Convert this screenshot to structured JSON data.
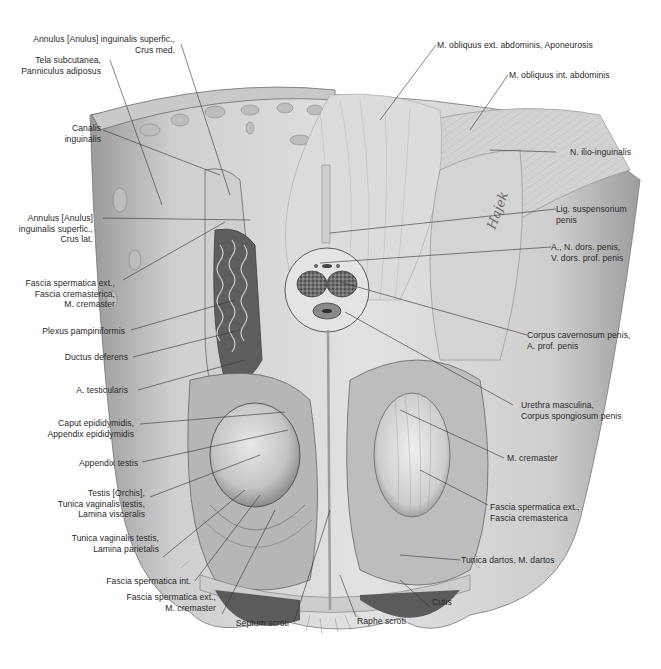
{
  "figure": {
    "signature": "Hajek",
    "colors": {
      "background": "#ffffff",
      "ink": "#2a2a2a",
      "tissue_light": "#d9d9d9",
      "tissue_mid": "#a8a8a8",
      "tissue_dark": "#5a5a5a"
    }
  },
  "labels_left": [
    {
      "id": "annulus-crus-med",
      "lines": [
        "Annulus [Anulus] inguinalis superfic.,",
        "Crus med."
      ]
    },
    {
      "id": "tela-subcutanea",
      "lines": [
        "Tela subcutanea,",
        "Panniculus adiposus"
      ]
    },
    {
      "id": "canalis-inguinalis",
      "lines": [
        "Canalis",
        "inguinalis"
      ]
    },
    {
      "id": "annulus-crus-lat",
      "lines": [
        "Annulus [Anulus]",
        "inguinalis superfic.,",
        "Crus lat."
      ]
    },
    {
      "id": "fascia-sperm-ext-crem",
      "lines": [
        "Fascia spermatica ext.,",
        "Fascia cremasterica,",
        "M. cremaster"
      ]
    },
    {
      "id": "plexus-pampiniformis",
      "lines": [
        "Plexus pampiniformis"
      ]
    },
    {
      "id": "ductus-deferens",
      "lines": [
        "Ductus deferens"
      ]
    },
    {
      "id": "a-testicularis",
      "lines": [
        "A. testicularis"
      ]
    },
    {
      "id": "caput-epididymidis",
      "lines": [
        "Caput epididymidis,",
        "Appendix epididymidis"
      ]
    },
    {
      "id": "appendix-testis",
      "lines": [
        "Appendix testis"
      ]
    },
    {
      "id": "testis-orchis",
      "lines": [
        "Testis [Orchis],",
        "Tunica vaginalis testis,",
        "Lamina visceralis"
      ]
    },
    {
      "id": "tunica-vag-parietalis",
      "lines": [
        "Tunica vaginalis testis,",
        "Lamina parietalis"
      ]
    },
    {
      "id": "fascia-sperm-int",
      "lines": [
        "Fascia spermatica int."
      ]
    },
    {
      "id": "fascia-sperm-ext-m-crem",
      "lines": [
        "Fascia spermatica ext.,",
        "M. cremaster"
      ]
    }
  ],
  "labels_bottom": [
    {
      "id": "septum-scroti",
      "lines": [
        "Septum scroti"
      ]
    },
    {
      "id": "raphe-scroti",
      "lines": [
        "Raphe scroti"
      ]
    },
    {
      "id": "cutis",
      "lines": [
        "Cutis"
      ]
    }
  ],
  "labels_right": [
    {
      "id": "m-obliquus-ext",
      "lines": [
        "M. obliquus ext. abdominis, Aponeurosis"
      ]
    },
    {
      "id": "m-obliquus-int",
      "lines": [
        "M. obliquus int. abdominis"
      ]
    },
    {
      "id": "n-ilio-inguinalis",
      "lines": [
        "N. ilio-inguinalis"
      ]
    },
    {
      "id": "lig-suspensorium",
      "lines": [
        "Lig. suspensorium",
        "penis"
      ]
    },
    {
      "id": "a-n-dors-penis",
      "lines": [
        "A., N. dors. penis,",
        "V. dors. prof. penis"
      ]
    },
    {
      "id": "corpus-cavernosum",
      "lines": [
        "Corpus cavernosum penis,",
        "A. prof. penis"
      ]
    },
    {
      "id": "urethra-masculina",
      "lines": [
        "Urethra masculina,",
        "Corpus spongiosum penis"
      ]
    },
    {
      "id": "m-cremaster",
      "lines": [
        "M. cremaster"
      ]
    },
    {
      "id": "fascia-sperm-ext-fascia-crem",
      "lines": [
        "Fascia spermatica ext.,",
        "Fascia cremasterica"
      ]
    },
    {
      "id": "tunica-dartos",
      "lines": [
        "Tunica dartos, M. dartos"
      ]
    }
  ]
}
